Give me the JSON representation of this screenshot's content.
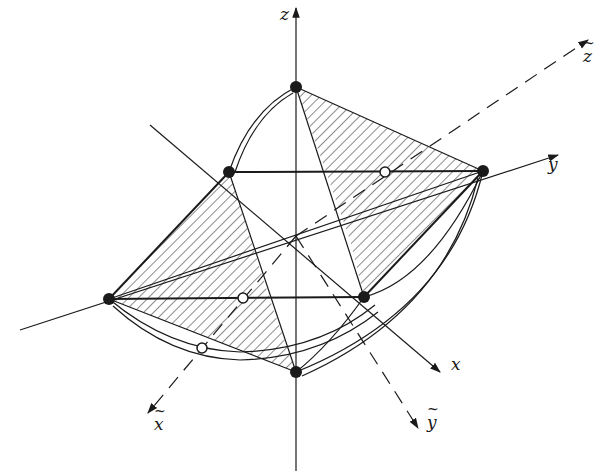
{
  "diagram": {
    "type": "geometric-3d-projection",
    "colors": {
      "ink": "#1a1a1a",
      "background": "#ffffff"
    },
    "axes": {
      "z": {
        "label": "z",
        "style": "solid"
      },
      "y": {
        "label": "y",
        "style": "solid"
      },
      "x": {
        "label": "x",
        "style": "solid"
      },
      "z_tilde": {
        "label": "z",
        "accent": "~",
        "style": "dashed"
      },
      "y_tilde": {
        "label": "y",
        "accent": "~",
        "style": "dashed"
      },
      "x_tilde": {
        "label": "x",
        "accent": "~",
        "style": "dashed"
      }
    },
    "vertices": {
      "top": [
        296,
        87
      ],
      "bottom": [
        296,
        372
      ],
      "upper_left": [
        229,
        172
      ],
      "right": [
        483,
        171
      ],
      "left": [
        109,
        299
      ],
      "lower_right": [
        364,
        297
      ]
    },
    "open_points": [
      [
        385,
        172
      ],
      [
        243,
        298
      ],
      [
        202,
        348
      ]
    ],
    "center": [
      296,
      236
    ],
    "hatched_regions": [
      "top-right triangle",
      "left triangle",
      "lower triangle"
    ]
  }
}
